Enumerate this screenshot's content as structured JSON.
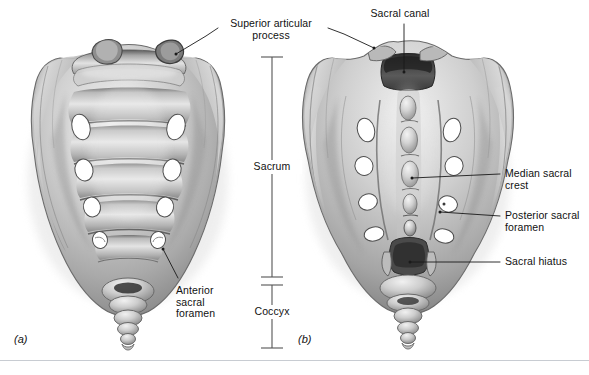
{
  "figure": {
    "background_color": "#ffffff",
    "text_color": "#111111",
    "rule_color": "#c8ccd2",
    "bone_light": "#f2f2f2",
    "bone_mid": "#b4b4b4",
    "bone_dark": "#6e6e6e",
    "foramen_fill": "#ffffff",
    "leader_color": "#1a1a1a"
  },
  "panels": [
    {
      "id": "panel-a",
      "label": "(a)",
      "view": "anterior",
      "x": 14,
      "y": 333
    },
    {
      "id": "panel-b",
      "label": "(b)",
      "view": "posterior",
      "x": 298,
      "y": 333
    }
  ],
  "labels": [
    {
      "name": "superior-articular-process",
      "text": "Superior articular\nprocess",
      "align": "center",
      "x": 215,
      "y": 18,
      "width": 112
    },
    {
      "name": "sacral-canal",
      "text": "Sacral canal",
      "align": "center",
      "x": 360,
      "y": 8,
      "width": 80
    },
    {
      "name": "anterior-sacral-foramen",
      "text": "Anterior\nsacral\nforamen",
      "align": "left",
      "x": 176,
      "y": 285,
      "width": 60
    },
    {
      "name": "median-sacral-crest",
      "text": "Median sacral\ncrest",
      "align": "left",
      "x": 505,
      "y": 168,
      "width": 84
    },
    {
      "name": "posterior-sacral-foramen",
      "text": "Posterior sacral\nforamen",
      "align": "left",
      "x": 505,
      "y": 210,
      "width": 84
    },
    {
      "name": "sacral-hiatus",
      "text": "Sacral hiatus",
      "align": "left",
      "x": 505,
      "y": 256,
      "width": 84
    }
  ],
  "bracket": {
    "name": "sacrum-coccyx-bracket",
    "x": 272,
    "top_y": 57,
    "mid_y_upper": 277,
    "mid_y_lower": 285,
    "bottom_y": 348,
    "tick_half_width": 11,
    "color": "#555555",
    "segments": [
      {
        "name": "sacrum",
        "label": "Sacrum",
        "label_x": 272,
        "label_y": 166
      },
      {
        "name": "coccyx",
        "label": "Coccyx",
        "label_x": 272,
        "label_y": 311
      }
    ]
  },
  "leaders": [
    {
      "name": "leader-superior-articular-process-left",
      "points": "176,54 206,36 218,28"
    },
    {
      "name": "leader-superior-articular-process-right",
      "points": "374,48 344,34 328,28"
    },
    {
      "name": "leader-sacral-canal",
      "points": "404,72 404,24"
    },
    {
      "name": "leader-anterior-sacral-foramen",
      "points": "163,249 178,278"
    },
    {
      "name": "leader-median-sacral-crest",
      "points": "412,178 500,174"
    },
    {
      "name": "leader-posterior-sacral-foramen",
      "points": "440,212 500,216"
    },
    {
      "name": "leader-sacral-hiatus",
      "points": "410,262 500,262"
    }
  ],
  "divider_rule": {
    "name": "bottom-divider",
    "y": 360
  }
}
